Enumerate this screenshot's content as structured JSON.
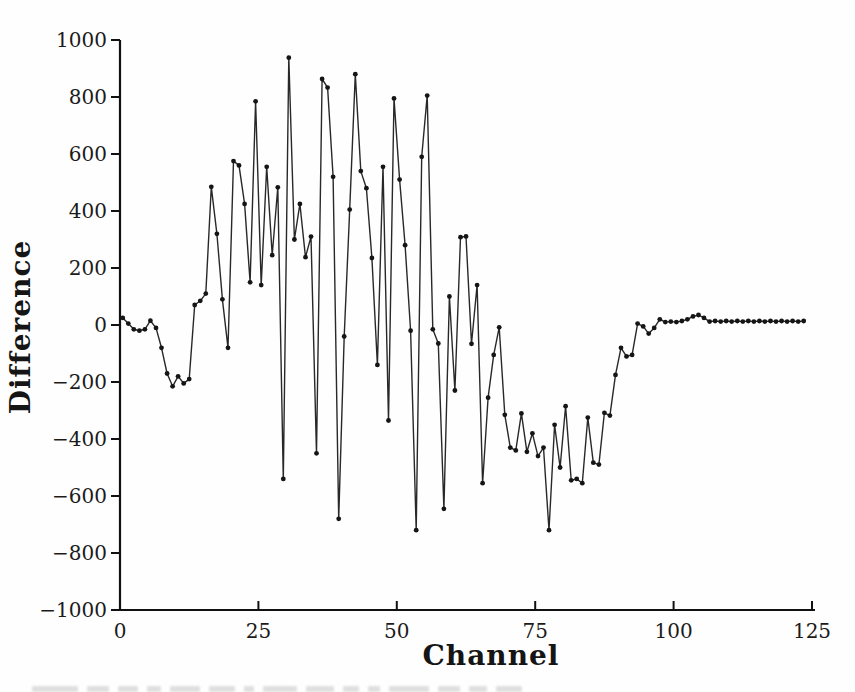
{
  "chart_data": {
    "type": "line",
    "title": "",
    "xlabel": "Channel",
    "ylabel": "Difference",
    "xlim": [
      0,
      125
    ],
    "ylim": [
      -1000,
      1000
    ],
    "x_ticks": [
      0,
      25,
      50,
      75,
      100,
      125
    ],
    "y_ticks": [
      -1000,
      -800,
      -600,
      -400,
      -200,
      0,
      200,
      400,
      600,
      800,
      1000
    ],
    "grid": false,
    "legend": "none",
    "marker": "filled-dot",
    "line_color": "#1c1c1c",
    "marker_color": "#151515",
    "axis_color": "#111111",
    "background_color": "#fefefe",
    "x_start": 0.5,
    "x_step": 1,
    "values": [
      25,
      5,
      -15,
      -20,
      -15,
      15,
      -10,
      -80,
      -170,
      -215,
      -180,
      -205,
      -190,
      70,
      85,
      110,
      485,
      320,
      90,
      -80,
      575,
      560,
      425,
      150,
      785,
      140,
      555,
      245,
      483,
      -540,
      938,
      300,
      425,
      238,
      310,
      -450,
      863,
      833,
      520,
      -680,
      -40,
      405,
      880,
      540,
      480,
      235,
      -140,
      555,
      -335,
      795,
      510,
      280,
      -20,
      -720,
      590,
      805,
      -15,
      -65,
      -645,
      100,
      -230,
      308,
      311,
      -66,
      140,
      -555,
      -255,
      -105,
      -8,
      -315,
      -430,
      -440,
      -310,
      -445,
      -380,
      -460,
      -430,
      -720,
      -350,
      -500,
      -285,
      -545,
      -540,
      -555,
      -325,
      -483,
      -490,
      -308,
      -318,
      -175,
      -80,
      -110,
      -105,
      5,
      -5,
      -30,
      -10,
      20,
      10,
      12,
      10,
      14,
      20,
      30,
      35,
      25,
      12,
      14,
      12,
      14,
      12,
      14,
      12,
      14,
      12,
      14,
      12,
      14,
      12,
      14,
      12,
      14,
      12,
      14
    ]
  }
}
